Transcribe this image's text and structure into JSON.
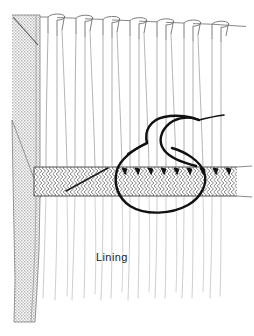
{
  "figure": {
    "type": "line-drawing",
    "background_color": "#ffffff",
    "ink_color": "#1a1a1a",
    "fabric_line_color": "#8c8c8c",
    "pleat_line_color": "#6e6e6e",
    "buckram_hatch_color": "#6b6b6b",
    "return_fill_color": "#c9c9c9",
    "thread_color": "#111111"
  },
  "labels": [
    {
      "id": "lining",
      "text": "Lining",
      "x": 96,
      "y": 261
    }
  ],
  "parts": {
    "return_panel": {
      "name": "return-panel",
      "description": "Shaded folded-back return at the leading edge",
      "fill": "#c9c9c9",
      "top_y": 15,
      "bottom_y": 322,
      "left_x": 12,
      "right_x": 40
    },
    "heading_band": {
      "name": "buckram-heading-band",
      "description": "Hatched crinoline / buckram stiffener band across the header",
      "top_y": 167,
      "bottom_y": 196,
      "left_x": 34,
      "right_x": 237,
      "hatch": "chevron"
    },
    "pleats": {
      "name": "pleat-loops",
      "count": 7,
      "positions_x": [
        48,
        76,
        103,
        130,
        157,
        184,
        212
      ],
      "top_y": 17,
      "loop_width": 17,
      "loop_height": 10
    },
    "drape_lines": {
      "name": "drape-fall-lines",
      "count": 14,
      "fade_bottom_y": 300
    },
    "stitches": {
      "name": "tacking-stitches",
      "count": 9,
      "start_x": 122,
      "spacing_x": 13,
      "baseline_y": 168
    },
    "thread": {
      "name": "needle-and-thread-loop",
      "loop_bottom_y": 212,
      "s_curve_end_x": 208,
      "tail_visible": true
    }
  },
  "icons": {
    "stitch": "stitch-tick-icon",
    "pleat": "pleat-fold-icon",
    "thread": "thread-loop-icon"
  }
}
